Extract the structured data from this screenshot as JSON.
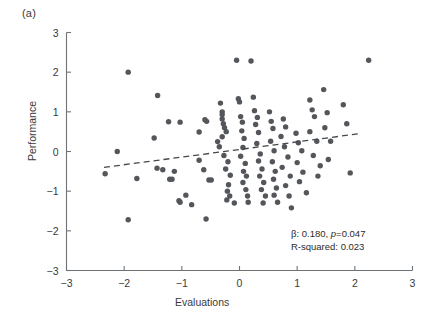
{
  "figure": {
    "panel_label": "(a)",
    "background_color": "#ffffff",
    "point_color": "#53565a",
    "axis_color": "#6e7378",
    "trendline_color": "#44474b"
  },
  "annotation": {
    "line1_prefix": "β: 0.180, ",
    "line1_italic": "p",
    "line1_suffix": "=0.047",
    "line2": "R-squared: 0.023"
  },
  "chart_data": {
    "type": "scatter",
    "title": "",
    "xlabel": "Evaluations",
    "ylabel": "Performance",
    "xlim": [
      -3,
      3
    ],
    "ylim": [
      -3,
      3
    ],
    "xticks": [
      -3,
      -2,
      -1,
      0,
      1,
      2,
      3
    ],
    "yticks": [
      -3,
      -2,
      -1,
      0,
      1,
      2,
      3
    ],
    "xticklabels": [
      "−3",
      "−2",
      "−1",
      "0",
      "1",
      "2",
      "3"
    ],
    "yticklabels": [
      "−3",
      "−2",
      "−1",
      "0",
      "1",
      "2",
      "3"
    ],
    "grid": false,
    "legend": false,
    "stats": {
      "beta": 0.18,
      "p_value": 0.047,
      "r_squared": 0.023
    },
    "trendline": {
      "style": "dashed",
      "x": [
        -2.35,
        2.08
      ],
      "y": [
        -0.4,
        0.45
      ],
      "slope": 0.192,
      "intercept": 0.051
    },
    "series": [
      {
        "name": "observations",
        "marker": "circle",
        "color": "#53565a",
        "points": [
          [
            -1.93,
            2.0
          ],
          [
            -1.42,
            1.41
          ],
          [
            -1.93,
            -1.72
          ],
          [
            -2.33,
            -0.56
          ],
          [
            -1.78,
            -0.68
          ],
          [
            -1.48,
            0.34
          ],
          [
            -1.23,
            0.75
          ],
          [
            -1.03,
            0.74
          ],
          [
            -1.43,
            -0.42
          ],
          [
            -1.33,
            -0.46
          ],
          [
            -1.13,
            -0.5
          ],
          [
            -1.21,
            -0.7
          ],
          [
            -1.17,
            -0.7
          ],
          [
            -0.93,
            -1.1
          ],
          [
            -1.05,
            -1.24
          ],
          [
            -1.03,
            -1.28
          ],
          [
            -0.83,
            -1.34
          ],
          [
            -0.7,
            -0.22
          ],
          [
            -0.7,
            0.49
          ],
          [
            -0.6,
            0.8
          ],
          [
            -0.57,
            0.76
          ],
          [
            -0.62,
            -0.46
          ],
          [
            -0.53,
            -0.72
          ],
          [
            -0.49,
            -0.72
          ],
          [
            -0.58,
            -1.7
          ],
          [
            -0.38,
            0.25
          ],
          [
            -0.33,
            1.22
          ],
          [
            -0.3,
            1.0
          ],
          [
            -0.3,
            0.93
          ],
          [
            -0.3,
            0.82
          ],
          [
            -0.28,
            0.7
          ],
          [
            -0.26,
            0.6
          ],
          [
            -0.23,
            0.5
          ],
          [
            -0.3,
            0.37
          ],
          [
            -0.35,
            0.12
          ],
          [
            -0.27,
            -0.1
          ],
          [
            -0.2,
            -0.26
          ],
          [
            -0.24,
            -0.44
          ],
          [
            -0.16,
            -0.6
          ],
          [
            -0.19,
            -0.84
          ],
          [
            -0.21,
            -1.0
          ],
          [
            -0.17,
            -1.12
          ],
          [
            -0.22,
            -1.22
          ],
          [
            -0.09,
            -1.3
          ],
          [
            -0.05,
            2.3
          ],
          [
            -0.02,
            1.33
          ],
          [
            0.0,
            1.25
          ],
          [
            0.02,
            0.88
          ],
          [
            0.05,
            0.74
          ],
          [
            0.04,
            0.52
          ],
          [
            0.08,
            0.33
          ],
          [
            0.06,
            0.1
          ],
          [
            0.02,
            -0.12
          ],
          [
            0.1,
            -0.3
          ],
          [
            0.07,
            -0.5
          ],
          [
            0.12,
            -0.62
          ],
          [
            0.06,
            -0.78
          ],
          [
            0.11,
            -0.96
          ],
          [
            0.14,
            -1.12
          ],
          [
            0.15,
            -1.28
          ],
          [
            0.2,
            2.28
          ],
          [
            0.24,
            1.37
          ],
          [
            0.26,
            1.03
          ],
          [
            0.31,
            0.86
          ],
          [
            0.28,
            0.68
          ],
          [
            0.33,
            0.48
          ],
          [
            0.3,
            0.2
          ],
          [
            0.36,
            -0.06
          ],
          [
            0.33,
            -0.24
          ],
          [
            0.39,
            -0.44
          ],
          [
            0.35,
            -0.62
          ],
          [
            0.42,
            -0.78
          ],
          [
            0.38,
            -0.96
          ],
          [
            0.45,
            -1.12
          ],
          [
            0.41,
            -1.3
          ],
          [
            0.52,
            1.0
          ],
          [
            0.55,
            0.76
          ],
          [
            0.58,
            0.58
          ],
          [
            0.54,
            0.26
          ],
          [
            0.6,
            0.02
          ],
          [
            0.57,
            -0.26
          ],
          [
            0.62,
            -0.5
          ],
          [
            0.59,
            -0.7
          ],
          [
            0.64,
            -0.92
          ],
          [
            0.6,
            -1.1
          ],
          [
            0.66,
            -1.28
          ],
          [
            0.76,
            0.82
          ],
          [
            0.8,
            0.62
          ],
          [
            0.72,
            0.38
          ],
          [
            0.78,
            0.12
          ],
          [
            0.84,
            -0.14
          ],
          [
            0.74,
            -0.4
          ],
          [
            0.88,
            -0.62
          ],
          [
            0.8,
            -0.86
          ],
          [
            0.86,
            -1.12
          ],
          [
            0.9,
            -1.42
          ],
          [
            0.98,
            0.46
          ],
          [
            1.02,
            0.22
          ],
          [
            1.08,
            0.02
          ],
          [
            1.0,
            -0.28
          ],
          [
            1.1,
            -0.52
          ],
          [
            1.04,
            -0.76
          ],
          [
            1.16,
            -1.04
          ],
          [
            1.22,
            1.3
          ],
          [
            1.26,
            1.05
          ],
          [
            1.3,
            0.88
          ],
          [
            1.22,
            0.5
          ],
          [
            1.34,
            0.26
          ],
          [
            1.28,
            -0.1
          ],
          [
            1.4,
            -0.36
          ],
          [
            1.36,
            -0.62
          ],
          [
            1.46,
            1.56
          ],
          [
            1.52,
            0.98
          ],
          [
            1.48,
            0.6
          ],
          [
            1.58,
            0.26
          ],
          [
            1.54,
            -0.2
          ],
          [
            1.8,
            1.18
          ],
          [
            1.86,
            0.7
          ],
          [
            1.92,
            -0.54
          ],
          [
            2.24,
            2.3
          ],
          [
            -2.12,
            0.0
          ]
        ]
      }
    ]
  }
}
